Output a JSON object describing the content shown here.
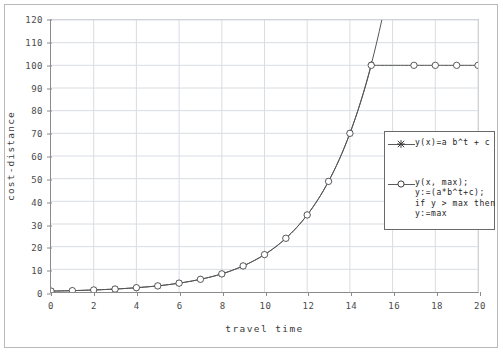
{
  "chart_data": {
    "type": "line",
    "title": "",
    "xlabel": "travel time",
    "ylabel": "cost-distance",
    "xlim": [
      0,
      20
    ],
    "ylim": [
      0,
      120
    ],
    "xticks": [
      0,
      2,
      4,
      6,
      8,
      10,
      12,
      14,
      16,
      18,
      20
    ],
    "xtick_labels": [
      "0",
      "2",
      "4",
      "6",
      "8",
      "10",
      "12",
      "14",
      "16",
      "18",
      "20"
    ],
    "yticks": [
      0,
      10,
      20,
      30,
      40,
      50,
      60,
      70,
      80,
      90,
      100,
      110,
      120
    ],
    "ytick_labels": [
      "0",
      "10",
      "20",
      "30",
      "40",
      "50",
      "60",
      "70",
      "80",
      "90",
      "100",
      "110",
      "120"
    ],
    "grid": true,
    "legend_position": "right-center",
    "x": [
      0,
      1,
      2,
      3,
      4,
      5,
      6,
      7,
      8,
      9,
      10,
      11,
      12,
      13,
      14,
      15,
      16,
      17,
      18,
      19,
      20
    ],
    "series": [
      {
        "name": "y(x)=a b^t + c",
        "marker": "star",
        "color": "#555555",
        "clipped_at_axis_top": true,
        "values": [
          0.4,
          0.6,
          0.9,
          1.3,
          1.9,
          2.7,
          3.9,
          5.6,
          8.0,
          11.5,
          16.5,
          23.7,
          34.0,
          48.8,
          70.0,
          100.4,
          144.0,
          206.6,
          296.5,
          425.5,
          610.6
        ]
      },
      {
        "name": "y(x, max)",
        "marker": "circle",
        "color": "#555555",
        "values": [
          0.4,
          0.6,
          0.9,
          1.3,
          1.9,
          2.7,
          3.9,
          5.6,
          8.0,
          11.5,
          16.5,
          23.7,
          34.0,
          48.8,
          70.0,
          100.0,
          100.0,
          100.0,
          100.0,
          100.0,
          100.0
        ]
      }
    ],
    "legend": [
      {
        "marker": "star",
        "lines": [
          "y(x)=a b^t + c"
        ]
      },
      {
        "marker": "circle",
        "lines": [
          "y(x, max);",
          "y:=(a*b^t+c);",
          "if y > max then",
          "y:=max"
        ]
      }
    ],
    "annotations": {
      "plateau_value": 100,
      "plateau_start_x": 15,
      "curve_exits_top_between": [
        15,
        16
      ]
    }
  },
  "colors": {
    "axis": "#8a8a8a",
    "grid": "#d8dde3",
    "line": "#555555",
    "frame": "#b9b9b9",
    "text": "#3a3a3a",
    "background": "#ffffff"
  }
}
